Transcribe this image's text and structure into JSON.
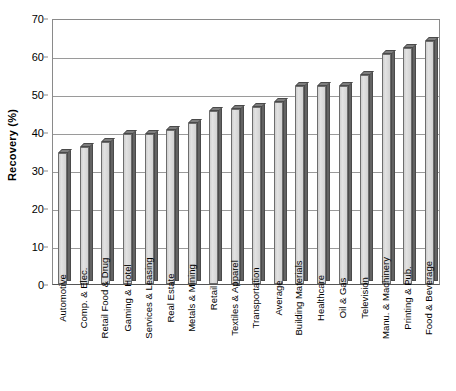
{
  "chart_data": {
    "type": "bar",
    "title": "",
    "subtitle": "",
    "xlabel": "",
    "ylabel": "Recovery (%)",
    "ylim": [
      0,
      70
    ],
    "ytick_step": 10,
    "yticks": [
      0,
      10,
      20,
      30,
      40,
      50,
      60,
      70
    ],
    "grid": true,
    "legend": false,
    "legend_position": "none",
    "orientation": "vertical",
    "style": "3d-shaded-grayscale",
    "categories": [
      "Automotive",
      "Comp. & Elec.",
      "Retail Food & Drug",
      "Gaming & Hotel",
      "Services & Leasing",
      "Real Estate",
      "Metals & Mining",
      "Retail",
      "Textiles & Apparel",
      "Transportation",
      "Average",
      "Building Materials",
      "Healthcare",
      "Oil & Gas",
      "Television",
      "Manu. & Machinery",
      "Printing & Pub.",
      "Food & Beverage"
    ],
    "values": [
      34.5,
      36,
      37.5,
      39.5,
      39.5,
      40.5,
      42.5,
      45.5,
      46,
      46.5,
      48,
      52,
      52,
      52,
      55,
      60.5,
      62,
      64
    ],
    "colors": {
      "bar_face": "#d8d8d8",
      "bar_side": "#636363",
      "bar_outline": "#6d6d6d",
      "gridline": "#9a9a9a",
      "axis": "#8a8a8a",
      "text": "#000000",
      "background": "#ffffff"
    }
  }
}
